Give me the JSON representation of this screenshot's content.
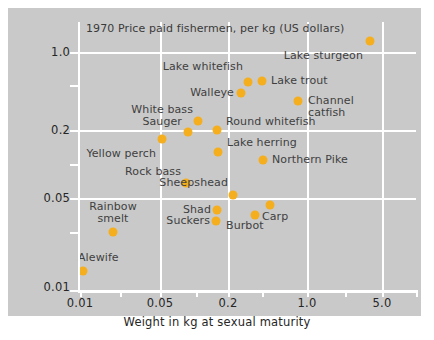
{
  "figure": {
    "title": "1970 Price paid fishermen, per kg (US dollars)",
    "xaxis_title": "Weight in kg at sexual maturity",
    "point_color": "#f5ae1e",
    "panel_color": "#c9c9c9",
    "grid_color": "#ffffff"
  },
  "chart_data": {
    "type": "scatter",
    "title": "1970 Price paid fishermen, per kg (US dollars)",
    "xlabel": "Weight in kg at sexual maturity",
    "ylabel": "",
    "xscale": "log",
    "yscale": "log",
    "xlim": [
      0.01,
      7.0
    ],
    "ylim": [
      0.01,
      1.4
    ],
    "grid": true,
    "legend": "none",
    "xticks": [
      0.01,
      0.05,
      0.2,
      1.0,
      5.0
    ],
    "xticklabels": [
      "0.01",
      "0.05",
      "0.2",
      "1.0",
      "5.0"
    ],
    "yticks": [
      0.01,
      0.05,
      0.2,
      1.0
    ],
    "yticklabels": [
      "0.01",
      "0.05",
      "0.2",
      "1.0"
    ],
    "points": [
      {
        "label": "Lake sturgeon",
        "x": 4.0,
        "y": 1.25,
        "label_pos": "below-left"
      },
      {
        "label": "Lake whitefish",
        "x": 0.3,
        "y": 0.55,
        "label_pos": "above-left"
      },
      {
        "label": "Lake trout",
        "x": 0.4,
        "y": 0.56,
        "label_pos": "right"
      },
      {
        "label": "Walleye",
        "x": 0.23,
        "y": 0.42,
        "label_pos": "left"
      },
      {
        "label": "Channel catfish",
        "x": 0.85,
        "y": 0.34,
        "label_pos": "right"
      },
      {
        "label": "White bass",
        "x": 0.135,
        "y": 0.245,
        "label_pos": "above-left"
      },
      {
        "label": "Round whitefish",
        "x": 0.205,
        "y": 0.215,
        "label_pos": "right"
      },
      {
        "label": "Sauger",
        "x": 0.115,
        "y": 0.2,
        "label_pos": "left"
      },
      {
        "label": "Yellow perch",
        "x": 0.062,
        "y": 0.175,
        "label_pos": "below-left"
      },
      {
        "label": "Lake herring",
        "x": 0.21,
        "y": 0.135,
        "label_pos": "above-right"
      },
      {
        "label": "Northern Pike",
        "x": 0.44,
        "y": 0.122,
        "label_pos": "right"
      },
      {
        "label": "Rock bass",
        "x": 0.125,
        "y": 0.072,
        "label_pos": "above-left"
      },
      {
        "label": "Sheepshead",
        "x": 0.24,
        "y": 0.058,
        "label_pos": "above-right"
      },
      {
        "label": "Carp",
        "x": 0.62,
        "y": 0.05,
        "label_pos": "below-right"
      },
      {
        "label": "Shad",
        "x": 0.205,
        "y": 0.044,
        "label_pos": "left"
      },
      {
        "label": "Burbot",
        "x": 0.44,
        "y": 0.041,
        "label_pos": "below-left"
      },
      {
        "label": "Suckers",
        "x": 0.205,
        "y": 0.037,
        "label_pos": "left"
      },
      {
        "label": "Rainbow smelt",
        "x": 0.029,
        "y": 0.031,
        "label_pos": "above"
      },
      {
        "label": "Alewife",
        "x": 0.017,
        "y": 0.0125,
        "label_pos": "above-left"
      }
    ]
  },
  "rendered": {
    "points": [
      {
        "name": "lake-sturgeon",
        "px": 370,
        "py": 41,
        "label": "Lake sturgeon",
        "lx": 363,
        "ly": 56,
        "align": "r"
      },
      {
        "name": "lake-whitefish",
        "px": 248,
        "py": 82,
        "label": "Lake whitefish",
        "lx": 243,
        "ly": 67,
        "align": "r"
      },
      {
        "name": "lake-trout",
        "px": 262,
        "py": 81,
        "label": "Lake trout",
        "lx": 271,
        "ly": 81,
        "align": "l"
      },
      {
        "name": "walleye",
        "px": 241,
        "py": 93,
        "label": "Walleye",
        "lx": 234,
        "ly": 93,
        "align": "r"
      },
      {
        "name": "channel-catfish",
        "px": 298,
        "py": 101,
        "label": "Channel",
        "lx": 308,
        "ly": 101,
        "align": "l"
      },
      {
        "name": "white-bass",
        "px": 198,
        "py": 121,
        "label": "White bass",
        "lx": 193,
        "ly": 110,
        "align": "r"
      },
      {
        "name": "round-whitefish",
        "px": 217,
        "py": 130,
        "label": "Round whitefish",
        "lx": 226,
        "ly": 122,
        "align": "l"
      },
      {
        "name": "sauger",
        "px": 188,
        "py": 132,
        "label": "Sauger",
        "lx": 182,
        "ly": 122,
        "align": "r"
      },
      {
        "name": "yellow-perch",
        "px": 162,
        "py": 139,
        "label": "Yellow perch",
        "lx": 156,
        "ly": 154,
        "align": "r"
      },
      {
        "name": "lake-herring",
        "px": 218,
        "py": 152,
        "label": "Lake herring",
        "lx": 227,
        "ly": 143,
        "align": "l"
      },
      {
        "name": "northern-pike",
        "px": 263,
        "py": 160,
        "label": "Northern Pike",
        "lx": 272,
        "ly": 160,
        "align": "l"
      },
      {
        "name": "rock-bass",
        "px": 186,
        "py": 183,
        "label": "Rock bass",
        "lx": 181,
        "ly": 172,
        "align": "r"
      },
      {
        "name": "sheepshead",
        "px": 233,
        "py": 195,
        "label": "Sheepshead",
        "lx": 228,
        "ly": 183,
        "align": "r"
      },
      {
        "name": "carp",
        "px": 270,
        "py": 205,
        "label": "Carp",
        "lx": 262,
        "ly": 217,
        "align": "l"
      },
      {
        "name": "shad",
        "px": 217,
        "py": 210,
        "label": "Shad",
        "lx": 211,
        "ly": 210,
        "align": "r"
      },
      {
        "name": "burbot",
        "px": 255,
        "py": 215,
        "label": "Burbot",
        "lx": 226,
        "ly": 226,
        "align": "l"
      },
      {
        "name": "suckers",
        "px": 216,
        "py": 221,
        "label": "Suckers",
        "lx": 210,
        "ly": 221,
        "align": "r"
      },
      {
        "name": "rainbow-smelt",
        "px": 113,
        "py": 232,
        "label": "Rainbow",
        "lx": 113,
        "ly": 207,
        "align": "c"
      },
      {
        "name": "alewife",
        "px": 83,
        "py": 271,
        "label": "Alewife",
        "lx": 78,
        "ly": 258,
        "align": "l"
      }
    ],
    "extra_labels": [
      {
        "name": "channel-catfish-line2",
        "text": "catfish",
        "lx": 308,
        "ly": 113,
        "align": "l"
      },
      {
        "name": "rainbow-smelt-line2",
        "text": "smelt",
        "lx": 113,
        "ly": 219,
        "align": "c"
      }
    ],
    "y_gridlines_px": [
      52,
      130,
      198
    ],
    "y_ticks_px": [
      85,
      164,
      232,
      290
    ],
    "x_gridlines_px": [
      160,
      228,
      307,
      382
    ],
    "x_ticks_px": [
      80,
      120,
      196,
      262,
      345,
      416
    ],
    "y_tick_labels": [
      {
        "text": "1.0",
        "py": 52
      },
      {
        "text": "0.2",
        "py": 130
      },
      {
        "text": "0.05",
        "py": 198
      },
      {
        "text": "0.01",
        "py": 287
      }
    ],
    "x_tick_labels": [
      {
        "text": "0.01",
        "px": 80
      },
      {
        "text": "0.05",
        "px": 160
      },
      {
        "text": "0.2",
        "px": 228
      },
      {
        "text": "1.0",
        "px": 307
      },
      {
        "text": "5.0",
        "px": 382
      }
    ]
  }
}
